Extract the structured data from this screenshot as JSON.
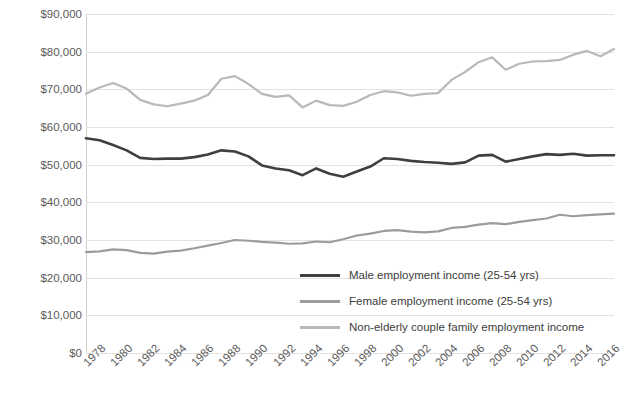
{
  "chart_data": {
    "type": "line",
    "title": "",
    "xlabel": "",
    "ylabel": "",
    "ylim": [
      0,
      90000
    ],
    "yticks": [
      "$0",
      "$10,000",
      "$20,000",
      "$30,000",
      "$40,000",
      "$50,000",
      "$60,000",
      "$70,000",
      "$80,000",
      "$90,000"
    ],
    "ytick_values": [
      0,
      10000,
      20000,
      30000,
      40000,
      50000,
      60000,
      70000,
      80000,
      90000
    ],
    "grid": true,
    "legend_position": "inside-bottom-right",
    "x": [
      1978,
      1979,
      1980,
      1981,
      1982,
      1983,
      1984,
      1985,
      1986,
      1987,
      1988,
      1989,
      1990,
      1991,
      1992,
      1993,
      1994,
      1995,
      1996,
      1997,
      1998,
      1999,
      2000,
      2001,
      2002,
      2003,
      2004,
      2005,
      2006,
      2007,
      2008,
      2009,
      2010,
      2011,
      2012,
      2013,
      2014,
      2015,
      2016,
      2017
    ],
    "xtick_labels": [
      "1978",
      "1980",
      "1982",
      "1984",
      "1986",
      "1988",
      "1990",
      "1992",
      "1994",
      "1996",
      "1998",
      "2000",
      "2002",
      "2004",
      "2006",
      "2008",
      "2010",
      "2012",
      "2014",
      "2016"
    ],
    "series": [
      {
        "name": "Male employment income (25-54 yrs)",
        "color": "#3f3f3f",
        "values": [
          57000,
          56500,
          55200,
          53800,
          51800,
          51500,
          51600,
          51600,
          52000,
          52700,
          53800,
          53500,
          52200,
          49800,
          49000,
          48500,
          47200,
          49000,
          47600,
          46800,
          48200,
          49500,
          51700,
          51500,
          51000,
          50700,
          50500,
          50200,
          50600,
          52400,
          52600,
          50800,
          51500,
          52200,
          52800,
          52600,
          52900,
          52400,
          52500,
          52500
        ]
      },
      {
        "name": "Female employment income (25-54 yrs)",
        "color": "#9c9c9c",
        "values": [
          26800,
          27000,
          27500,
          27300,
          26600,
          26400,
          26900,
          27200,
          27800,
          28500,
          29200,
          30000,
          29800,
          29500,
          29300,
          29000,
          29100,
          29600,
          29400,
          30200,
          31200,
          31700,
          32400,
          32600,
          32200,
          32000,
          32300,
          33200,
          33500,
          34100,
          34500,
          34200,
          34800,
          35300,
          35700,
          36700,
          36300,
          36600,
          36800,
          37000
        ]
      },
      {
        "name": "Non-elderly couple family employment income",
        "color": "#b9b9b9",
        "values": [
          68800,
          70500,
          71700,
          70200,
          67200,
          66000,
          65500,
          66200,
          67000,
          68500,
          72800,
          73500,
          71400,
          68800,
          68000,
          68400,
          65200,
          67000,
          65800,
          65600,
          66700,
          68500,
          69500,
          69200,
          68300,
          68800,
          69000,
          72500,
          74600,
          77200,
          78500,
          75200,
          76800,
          77400,
          77500,
          77800,
          79200,
          80200,
          78800,
          80700
        ]
      }
    ]
  },
  "legend": {
    "items": [
      {
        "label": "Male employment income (25-54 yrs)",
        "color": "#3f3f3f"
      },
      {
        "label": "Female employment income (25-54 yrs)",
        "color": "#9c9c9c"
      },
      {
        "label": "Non-elderly couple family employment income",
        "color": "#b9b9b9"
      }
    ]
  }
}
